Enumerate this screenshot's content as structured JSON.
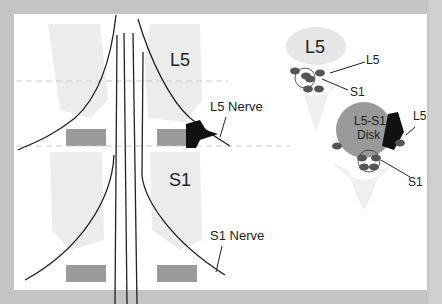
{
  "labels": {
    "vertebra_l5": "L5",
    "vertebra_s1": "S1",
    "l5_nerve": "L5 Nerve",
    "s1_nerve": "S1 Nerve",
    "axial_top_vertebra": "L5",
    "axial_top_l5_root": "L5",
    "axial_top_s1_root": "S1",
    "disk_line1": "L5-S1",
    "disk_line2": "Disk",
    "axial_bottom_l5_root": "L5",
    "axial_bottom_s1_root": "S1"
  },
  "colors": {
    "background": "#c4c4c4",
    "panel": "#ffffff",
    "bone": "#ececec",
    "disk": "#9a9a9a",
    "root": "#555555",
    "herniation": "#111111"
  }
}
